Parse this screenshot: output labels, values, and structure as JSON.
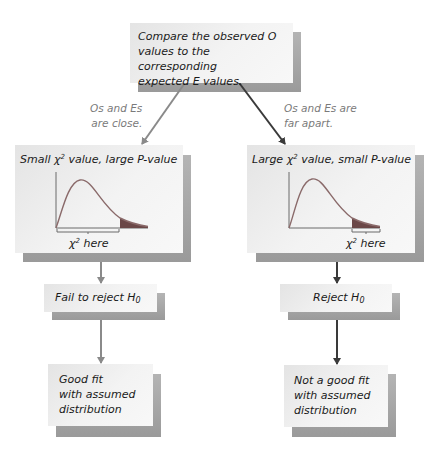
{
  "colors": {
    "box_fill": "#f0f0f0",
    "shadow": "#a8a8a8",
    "arrow_left": "#8a8a8a",
    "arrow_right": "#3a3a3a",
    "curve": "#8a6a6a",
    "tail_fill": "#6b4848",
    "note_text": "#7a7a7a"
  },
  "top": {
    "line1": "Compare the observed O",
    "line2": "values to the corresponding",
    "line3": "expected E values."
  },
  "notes": {
    "left_line1": "Os and Es",
    "left_line2": "are close.",
    "right_line1": "Os and Es are",
    "right_line2": "far apart."
  },
  "left": {
    "title_pre": "Small",
    "title_chi": "χ",
    "title_sup": "2",
    "title_post": "value, large P-value",
    "chi_label": "χ",
    "chi_sup": "2",
    "here": "here",
    "decision_pre": "Fail to reject H",
    "decision_sub": "0",
    "result_line1": "Good fit",
    "result_line2": "with assumed",
    "result_line3": "distribution"
  },
  "right": {
    "title_pre": "Large",
    "title_chi": "χ",
    "title_sup": "2",
    "title_post": "value, small P-value",
    "chi_label": "χ",
    "chi_sup": "2",
    "here": "here",
    "decision_pre": "Reject H",
    "decision_sub": "0",
    "result_line1": "Not a good fit",
    "result_line2": "with assumed",
    "result_line3": "distribution"
  }
}
